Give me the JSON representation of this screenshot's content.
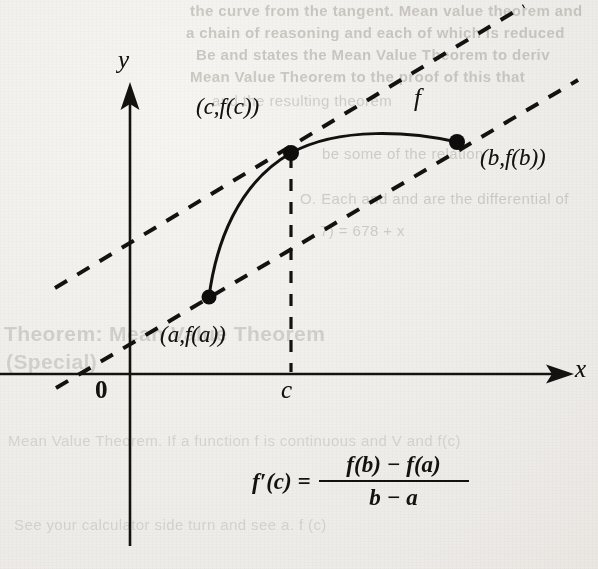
{
  "figure": {
    "axes": {
      "y_label": "y",
      "x_label": "x",
      "origin_label": "0",
      "x_tick_label": "c"
    },
    "labels": {
      "point_c": "(c,f(c))",
      "point_b": "(b,f(b))",
      "point_a": "(a,f(a))",
      "function": "f"
    },
    "formula": {
      "lhs": "f′(c)  =",
      "numerator": "f(b) − f(a)",
      "denominator": "b − a"
    },
    "colors": {
      "ink": "#141210",
      "paper": "#f3f1ee",
      "ghost": "#9c968d"
    }
  },
  "ghost_text": {
    "top_right": [
      "the curve from the tangent. Mean value theorem and",
      "a chain of reasoning and each of which is reduced",
      "Be and states the Mean Value Theorem to deriv",
      "Mean Value Theorem to the proof of this that",
      "and the resulting theorem",
      "be some of the relation",
      "O. Each and and are the differential of",
      "7) = 678 + x"
    ],
    "left_block": [
      "Theorem: Mean Value Theorem",
      "(Special)"
    ],
    "bottom_block": [
      "Mean Value Theorem. If a function f is continuous and V and f(c)",
      "See your calculator side turn and see a. f (c)"
    ]
  }
}
